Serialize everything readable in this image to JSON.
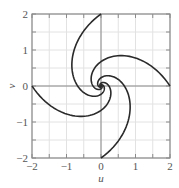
{
  "chart_data": {
    "type": "line",
    "title": "",
    "xlabel": "u",
    "ylabel": "v",
    "xlim": [
      -2,
      2
    ],
    "ylim": [
      -2,
      2
    ],
    "xticks": [
      -2,
      -1,
      0,
      1,
      2
    ],
    "yticks": [
      -2,
      -1,
      0,
      1,
      2
    ],
    "xtick_labels": [
      "−2",
      "−1",
      "0",
      "1",
      "2"
    ],
    "ytick_labels": [
      "−2",
      "−1",
      "0",
      "1",
      "2"
    ],
    "grid": true,
    "grid_step": 0.5,
    "legend": null,
    "spiral_model": {
      "r0": 2,
      "k": 1.45,
      "start_angles_deg": [
        0,
        90,
        180,
        270
      ],
      "max_turn_deg": 900,
      "samples": 300
    },
    "series": [
      {
        "name": "arm-from-(2,0)",
        "points": [
          [
            2.0,
            0.0
          ],
          [
            1.7,
            0.55
          ],
          [
            1.3,
            0.8
          ],
          [
            0.9,
            0.88
          ],
          [
            0.58,
            0.85
          ],
          [
            0.3,
            0.7
          ],
          [
            0.1,
            0.5
          ],
          [
            0.0,
            0.35
          ],
          [
            -0.1,
            0.15
          ],
          [
            -0.08,
            0.02
          ],
          [
            0.0,
            0.0
          ]
        ]
      },
      {
        "name": "arm-from-(0,2)",
        "points": [
          [
            0.0,
            2.0
          ],
          [
            -0.55,
            1.7
          ],
          [
            -0.8,
            1.3
          ],
          [
            -0.88,
            0.9
          ],
          [
            -0.85,
            0.58
          ],
          [
            -0.7,
            0.3
          ],
          [
            -0.5,
            0.1
          ],
          [
            -0.35,
            0.0
          ],
          [
            -0.15,
            -0.1
          ],
          [
            -0.02,
            -0.08
          ],
          [
            0.0,
            0.0
          ]
        ]
      },
      {
        "name": "arm-from-(-2,0)",
        "points": [
          [
            -2.0,
            0.0
          ],
          [
            -1.7,
            -0.55
          ],
          [
            -1.3,
            -0.8
          ],
          [
            -0.9,
            -0.88
          ],
          [
            -0.58,
            -0.85
          ],
          [
            -0.3,
            -0.7
          ],
          [
            -0.1,
            -0.5
          ],
          [
            0.0,
            -0.35
          ],
          [
            0.1,
            -0.15
          ],
          [
            0.08,
            -0.02
          ],
          [
            0.0,
            0.0
          ]
        ]
      },
      {
        "name": "arm-from-(0,-2)",
        "points": [
          [
            0.0,
            -2.0
          ],
          [
            0.55,
            -1.7
          ],
          [
            0.8,
            -1.3
          ],
          [
            0.88,
            -0.9
          ],
          [
            0.85,
            -0.58
          ],
          [
            0.7,
            -0.3
          ],
          [
            0.5,
            -0.1
          ],
          [
            0.35,
            0.0
          ],
          [
            0.15,
            0.1
          ],
          [
            0.02,
            0.08
          ],
          [
            0.0,
            0.0
          ]
        ]
      }
    ]
  },
  "colors": {
    "curve": "#2a2a2a",
    "grid": "#e2e2e2",
    "zero_axes": "#8a8a8a",
    "frame": "#8a8a8a",
    "text": "#555555"
  },
  "layout": {
    "plot_left": 32,
    "plot_top": 14,
    "plot_right": 170,
    "plot_bottom": 158
  }
}
